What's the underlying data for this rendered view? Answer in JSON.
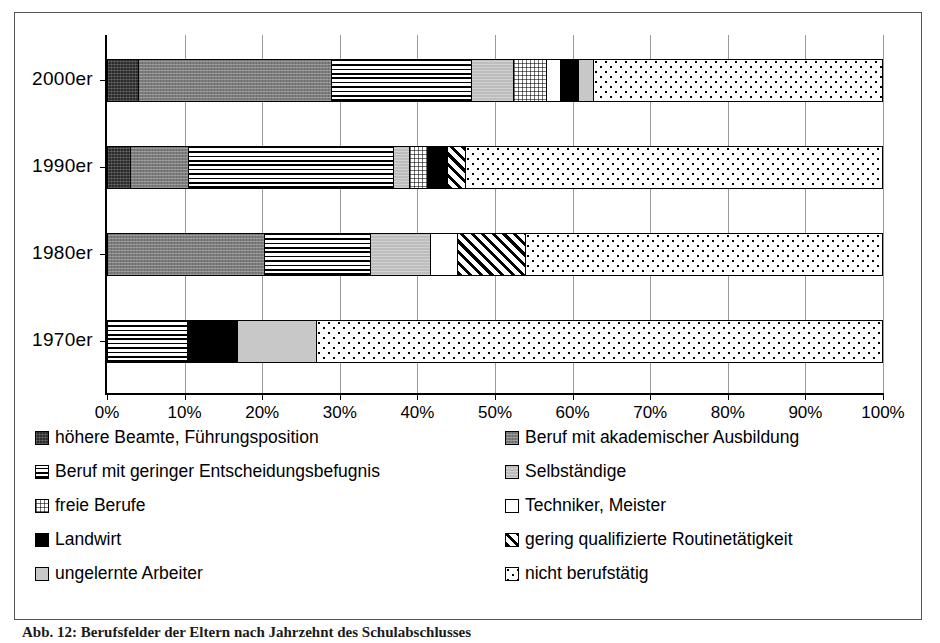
{
  "chart_data": {
    "type": "bar",
    "orientation": "horizontal",
    "stacked": true,
    "normalized_percent": true,
    "title": "",
    "xlabel": "",
    "ylabel": "",
    "xlim": [
      0,
      100
    ],
    "xticks": [
      "0%",
      "10%",
      "20%",
      "30%",
      "40%",
      "50%",
      "60%",
      "70%",
      "80%",
      "90%",
      "100%"
    ],
    "grid": "vertical",
    "legend_position": "bottom",
    "legend_columns": 2,
    "categories": [
      "2000er",
      "1990er",
      "1980er",
      "1970er"
    ],
    "series": [
      {
        "name": "höhere Beamte, Führungsposition",
        "pattern": "dark-speckle",
        "values": [
          4.0,
          3.0,
          0.0,
          0.0
        ]
      },
      {
        "name": "Beruf mit akademischer Ausbildung",
        "pattern": "mid-gray",
        "values": [
          25.0,
          7.5,
          20.3,
          0.0
        ]
      },
      {
        "name": "Beruf mit geringer Entscheidungsbefugnis",
        "pattern": "horizontal-lines",
        "values": [
          18.0,
          26.5,
          13.7,
          10.3
        ]
      },
      {
        "name": "Selbständige",
        "pattern": "light-gray",
        "values": [
          5.4,
          2.0,
          7.7,
          0.0
        ]
      },
      {
        "name": "freie Berufe",
        "pattern": "checker-dots",
        "values": [
          4.3,
          2.3,
          0.0,
          0.0
        ]
      },
      {
        "name": "Techniker, Meister",
        "pattern": "white",
        "values": [
          1.8,
          0.0,
          3.5,
          0.0
        ]
      },
      {
        "name": "Landwirt",
        "pattern": "solid-black",
        "values": [
          2.4,
          2.6,
          0.0,
          6.5
        ]
      },
      {
        "name": "gering qualifizierte Routinetätigkeit",
        "pattern": "diagonal-hatch",
        "values": [
          0.0,
          2.4,
          8.8,
          0.0
        ]
      },
      {
        "name": "ungelernte Arbeiter",
        "pattern": "pale-gray",
        "values": [
          1.9,
          0.0,
          0.0,
          10.2
        ]
      },
      {
        "name": "nicht berufstätig",
        "pattern": "sparse-dots",
        "values": [
          37.2,
          53.7,
          46.0,
          73.0
        ]
      }
    ]
  },
  "axis": {
    "ticks": [
      "0%",
      "10%",
      "20%",
      "30%",
      "40%",
      "50%",
      "60%",
      "70%",
      "80%",
      "90%",
      "100%"
    ]
  },
  "categories": [
    {
      "label": "2000er"
    },
    {
      "label": "1990er"
    },
    {
      "label": "1980er"
    },
    {
      "label": "1970er"
    }
  ],
  "legend": {
    "left_column": [
      {
        "label": "höhere Beamte, Führungsposition",
        "swatch": "dark-speckle"
      },
      {
        "label": "Beruf mit geringer Entscheidungsbefugnis",
        "swatch": "horizontal-lines"
      },
      {
        "label": "freie Berufe",
        "swatch": "checker-dots"
      },
      {
        "label": "Landwirt",
        "swatch": "solid-black"
      },
      {
        "label": "ungelernte Arbeiter",
        "swatch": "pale-gray"
      }
    ],
    "right_column": [
      {
        "label": "Beruf mit akademischer Ausbildung",
        "swatch": "mid-gray"
      },
      {
        "label": "Selbständige",
        "swatch": "light-gray"
      },
      {
        "label": "Techniker, Meister",
        "swatch": "white"
      },
      {
        "label": "gering qualifizierte Routinetätigkeit",
        "swatch": "diagonal-hatch"
      },
      {
        "label": "nicht berufstätig",
        "swatch": "sparse-dots"
      }
    ]
  },
  "caption": {
    "text": "Abb. 12:  Berufsfelder der Eltern nach Jahrzehnt des Schulabschlusses"
  },
  "colors": {
    "axis": "#000000",
    "gridline": "#9a9a9a",
    "frame": "#555555",
    "background": "#ffffff"
  }
}
